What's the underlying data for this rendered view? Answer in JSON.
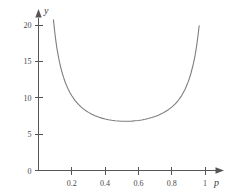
{
  "chart_data": {
    "type": "line",
    "title": "",
    "xlabel": "p",
    "ylabel": "y",
    "xlim": [
      0.0,
      1.06
    ],
    "ylim": [
      0.0,
      21.0
    ],
    "grid": false,
    "legend": null,
    "axis_style": "arrow-terminated",
    "curve_color": "#7d7d7d",
    "axis_color": "#555555",
    "xticks": [
      0.2,
      0.4,
      0.6,
      0.8,
      1.0
    ],
    "xtick_labels": [
      "0.2",
      "0.4",
      "0.6",
      "0.8",
      "1"
    ],
    "yticks": [
      0,
      5,
      10,
      15,
      20
    ],
    "ytick_labels": [
      "0",
      "5",
      "10",
      "15",
      "20"
    ],
    "minimum_point": {
      "x": 0.6,
      "y": 3.8
    },
    "series": [
      {
        "name": "y(p)",
        "x": [
          0.09,
          0.095,
          0.1,
          0.105,
          0.11,
          0.12,
          0.13,
          0.14,
          0.15,
          0.16,
          0.17,
          0.18,
          0.19,
          0.2,
          0.22,
          0.24,
          0.26,
          0.28,
          0.3,
          0.32,
          0.34,
          0.36,
          0.38,
          0.4,
          0.42,
          0.44,
          0.46,
          0.48,
          0.5,
          0.52,
          0.54,
          0.56,
          0.58,
          0.6,
          0.62,
          0.64,
          0.66,
          0.68,
          0.7,
          0.72,
          0.74,
          0.76,
          0.78,
          0.8,
          0.82,
          0.84,
          0.86,
          0.88,
          0.9,
          0.915,
          0.93,
          0.94,
          0.95,
          0.958,
          0.965,
          0.971,
          0.976,
          0.98,
          0.984,
          0.987,
          0.99
        ],
        "y": [
          20.7,
          19.55,
          18.55,
          17.68,
          16.9,
          15.58,
          14.5,
          13.6,
          12.83,
          12.17,
          11.6,
          11.1,
          10.66,
          10.27,
          9.61,
          9.08,
          8.65,
          8.29,
          7.99,
          7.74,
          7.53,
          7.35,
          7.2,
          7.08,
          6.98,
          6.9,
          6.84,
          6.8,
          6.77,
          6.76,
          6.77,
          6.79,
          6.83,
          6.88,
          6.95,
          7.04,
          7.15,
          7.28,
          7.43,
          7.61,
          7.82,
          8.07,
          8.36,
          8.71,
          9.13,
          9.65,
          10.3,
          11.13,
          12.25,
          13.3,
          14.65,
          15.75,
          17.15,
          18.55,
          19.9,
          21.3,
          22.6,
          23.7,
          25.1,
          26.25,
          27.6
        ]
      }
    ]
  },
  "axis_labels": {
    "y_symbol": "y",
    "x_symbol": "p"
  }
}
